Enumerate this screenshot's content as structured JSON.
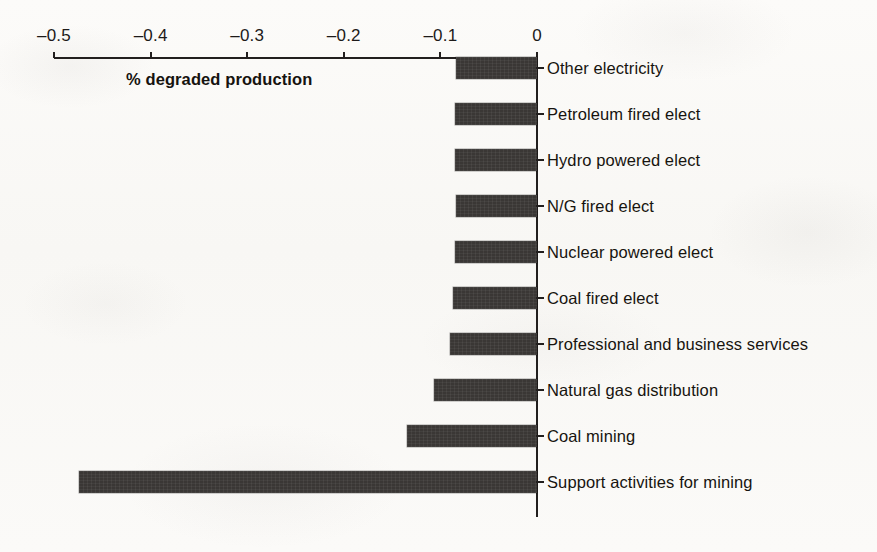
{
  "chart_data": {
    "type": "bar",
    "orientation": "horizontal",
    "title": "",
    "subtitle": "",
    "xlabel": "% degraded production",
    "ylabel": "",
    "xlim": [
      -0.5,
      0
    ],
    "xticks": [
      -0.5,
      -0.4,
      -0.3,
      -0.2,
      -0.1,
      0
    ],
    "xtick_labels": [
      "–0.5",
      "–0.4",
      "–0.3",
      "–0.2",
      "–0.1",
      "0"
    ],
    "grid": false,
    "legend": null,
    "bar_color": "#3a3735",
    "categories": [
      "Other electricity",
      "Petroleum fired elect",
      "Hydro powered elect",
      "N/G fired elect",
      "Nuclear powered elect",
      "Coal fired elect",
      "Professional and business services",
      "Natural gas distribution",
      "Coal mining",
      "Support activities for mining"
    ],
    "values": [
      -0.084,
      -0.085,
      -0.085,
      -0.084,
      -0.085,
      -0.087,
      -0.09,
      -0.107,
      -0.135,
      -0.474
    ],
    "series": [
      {
        "name": "% degraded production",
        "values": [
          -0.084,
          -0.085,
          -0.085,
          -0.084,
          -0.085,
          -0.087,
          -0.09,
          -0.107,
          -0.135,
          -0.474
        ]
      }
    ]
  },
  "figure": {
    "background_color": "#fbfaf8",
    "axis_color": "#221f1e",
    "text_color": "#17140f"
  }
}
